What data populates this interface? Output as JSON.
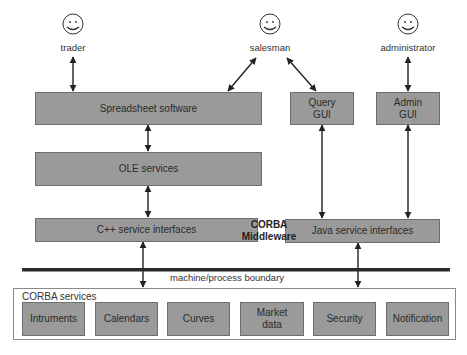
{
  "actors": [
    {
      "id": "trader",
      "label": "trader",
      "icon": "smiley-face-icon"
    },
    {
      "id": "salesman",
      "label": "salesman",
      "icon": "smiley-face-icon"
    },
    {
      "id": "administrator",
      "label": "administrator",
      "icon": "smiley-face-icon"
    }
  ],
  "client_layers": {
    "spreadsheet": "Spreadsheet software",
    "ole": "OLE services",
    "cpp": "C++ service interfaces",
    "query_gui_line1": "Query",
    "query_gui_line2": "GUI",
    "admin_gui_line1": "Admin",
    "admin_gui_line2": "GUI",
    "java": "Java service interfaces"
  },
  "middleware": {
    "line1": "CORBA",
    "line2": "Middleware"
  },
  "boundary": {
    "label": "machine/process boundary"
  },
  "corba_services": {
    "title": "CORBA services",
    "items": [
      {
        "line1": "Intruments",
        "line2": ""
      },
      {
        "line1": "Calendars",
        "line2": ""
      },
      {
        "line1": "Curves",
        "line2": ""
      },
      {
        "line1": "Market",
        "line2": "data"
      },
      {
        "line1": "Security",
        "line2": ""
      },
      {
        "line1": "Notification",
        "line2": ""
      }
    ]
  },
  "colors": {
    "box_fill": "#9a9a9a",
    "box_border": "#6e6e6e",
    "line": "#222222"
  }
}
